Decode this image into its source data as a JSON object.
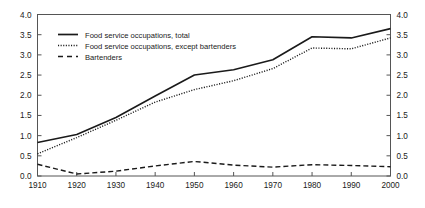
{
  "chart_data": {
    "type": "line",
    "title": "",
    "subtitle": "",
    "xlabel": "",
    "ylabel": "",
    "x": [
      1910,
      1920,
      1930,
      1940,
      1950,
      1960,
      1970,
      1980,
      1990,
      2000
    ],
    "xlim": [
      1910,
      2000
    ],
    "ylim": [
      0.0,
      4.0
    ],
    "y_ticks": [
      "0.0",
      "0.5",
      "1.0",
      "1.5",
      "2.0",
      "2.5",
      "3.0",
      "3.5",
      "4.0"
    ],
    "y_tick_values": [
      0.0,
      0.5,
      1.0,
      1.5,
      2.0,
      2.5,
      3.0,
      3.5,
      4.0
    ],
    "x_ticks": [
      "1910",
      "1920",
      "1930",
      "1940",
      "1950",
      "1960",
      "1970",
      "1980",
      "1990",
      "2000"
    ],
    "right_axis_ticks": [
      "0.0",
      "0.5",
      "1.0",
      "1.5",
      "2.0",
      "2.5",
      "3.0",
      "3.5",
      "4.0"
    ],
    "grid": false,
    "legend_position": "upper-left",
    "series": [
      {
        "name": "Food service occupations, total",
        "style": "solid",
        "color": "#1a1a1a",
        "values": [
          0.83,
          1.03,
          1.45,
          1.98,
          2.5,
          2.63,
          2.88,
          3.45,
          3.42,
          3.65
        ]
      },
      {
        "name": "Food service occupations, except bartenders",
        "style": "dotted",
        "color": "#1a1a1a",
        "values": [
          0.55,
          0.95,
          1.38,
          1.83,
          2.14,
          2.36,
          2.66,
          3.17,
          3.15,
          3.42
        ]
      },
      {
        "name": "Bartenders",
        "style": "dashed",
        "color": "#1a1a1a",
        "values": [
          0.29,
          0.05,
          0.12,
          0.25,
          0.36,
          0.27,
          0.22,
          0.28,
          0.26,
          0.23
        ]
      }
    ]
  },
  "legend": {
    "entries": [
      {
        "label": "Food service occupations, total",
        "style": "solid"
      },
      {
        "label": "Food service occupations, except bartenders",
        "style": "dotted"
      },
      {
        "label": "Bartenders",
        "style": "dashed"
      }
    ]
  },
  "axes": {
    "left": {
      "ticks": [
        "4.0",
        "3.5",
        "3.0",
        "2.5",
        "2.0",
        "1.5",
        "1.0",
        "0.5",
        "0.0"
      ]
    },
    "right": {
      "ticks": [
        "4.0",
        "3.5",
        "3.0",
        "2.5",
        "2.0",
        "1.5",
        "1.0",
        "0.5",
        "0.0"
      ]
    },
    "bottom": {
      "ticks": [
        "1910",
        "1920",
        "1930",
        "1940",
        "1950",
        "1960",
        "1970",
        "1980",
        "1990",
        "2000"
      ]
    }
  },
  "colors": {
    "line": "#1a1a1a",
    "frame": "#555555",
    "background": "#ffffff"
  }
}
